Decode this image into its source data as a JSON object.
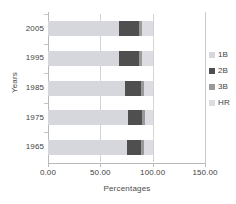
{
  "chart_data": {
    "type": "bar",
    "orientation": "horizontal",
    "stacked": true,
    "title": "",
    "xlabel": "Percentages",
    "ylabel": "Years",
    "categories": [
      "1965",
      "1975",
      "1985",
      "1995",
      "2005"
    ],
    "category_order_top_to_bottom": [
      "2005",
      "1995",
      "1985",
      "1975",
      "1965"
    ],
    "xlim": [
      0,
      150
    ],
    "xticks": [
      "0.00",
      "50.00",
      "100.00",
      "150.00"
    ],
    "xtick_values": [
      0,
      50,
      100,
      150
    ],
    "grid": true,
    "legend_position": "right",
    "series": [
      {
        "name": "1B",
        "color": "#d6d6dd",
        "values": [
          75,
          76,
          74,
          68,
          68
        ]
      },
      {
        "name": "2B",
        "color": "#4f4f4f",
        "values": [
          14,
          14,
          15,
          19,
          19
        ]
      },
      {
        "name": "3B",
        "color": "#9a9a9a",
        "values": [
          3,
          3,
          3,
          3,
          3
        ]
      },
      {
        "name": "HR",
        "color": "#dcdce2",
        "values": [
          8,
          7,
          8,
          10,
          10
        ]
      }
    ]
  },
  "legend": {
    "items": [
      {
        "label": "1B",
        "color": "#d6d6dd"
      },
      {
        "label": "2B",
        "color": "#4f4f4f"
      },
      {
        "label": "3B",
        "color": "#9a9a9a"
      },
      {
        "label": "HR",
        "color": "#dcdce2"
      }
    ]
  }
}
